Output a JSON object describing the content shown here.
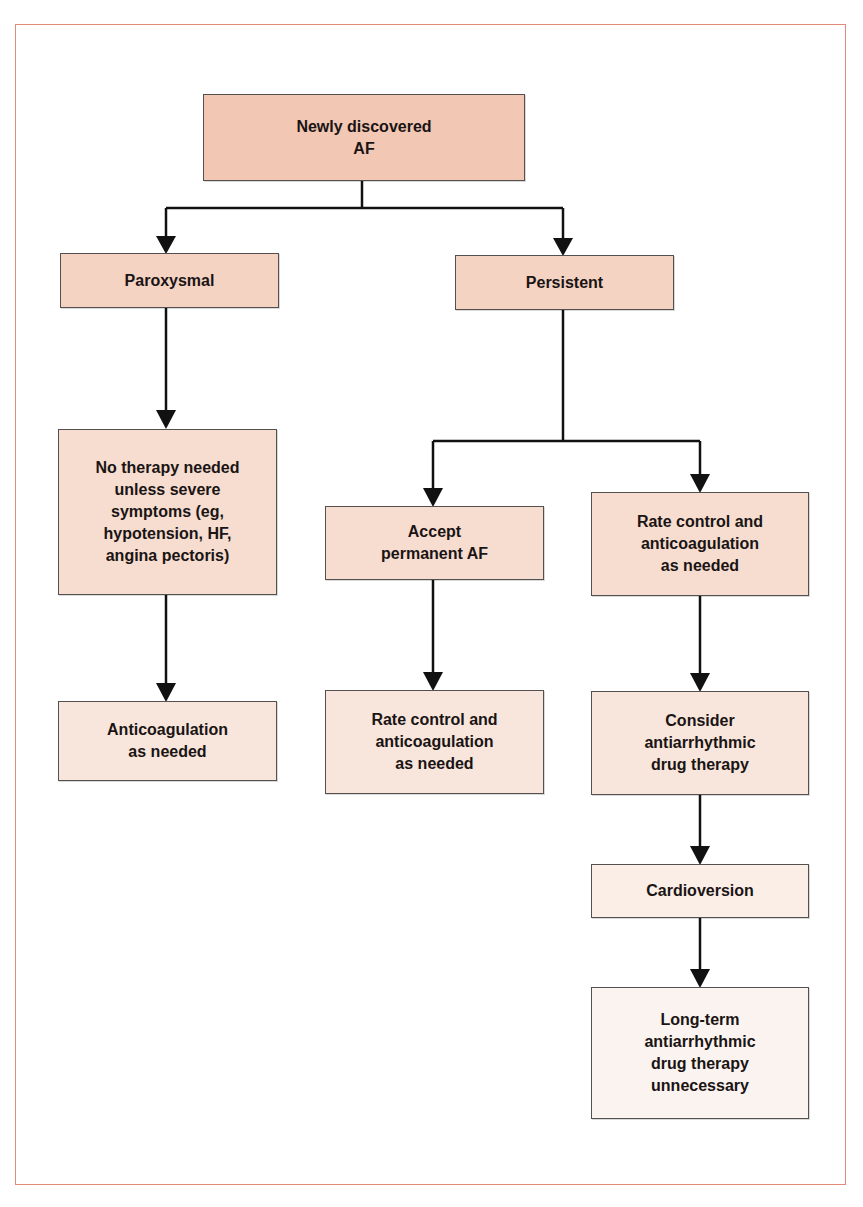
{
  "diagram": {
    "type": "flowchart",
    "frame_color": "#e08a7a",
    "nodes": {
      "root": "Newly discovered\nAF",
      "paroxysmal": "Paroxysmal",
      "persistent": "Persistent",
      "no_therapy": "No therapy needed\nunless severe\nsymptoms (eg,\nhypotension, HF,\nangina pectoris)",
      "anticoagulation": "Anticoagulation\nas needed",
      "accept_permanent": "Accept\npermanent AF",
      "rate_control_right": "Rate control and\nanticoagulation\nas needed",
      "rate_control_mid": "Rate control and\nanticoagulation\nas needed",
      "consider_antiarrhythmic": "Consider\nantiarrhythmic\ndrug therapy",
      "cardioversion": "Cardioversion",
      "long_term": "Long-term\nantiarrhythmic\ndrug therapy\nunnecessary"
    },
    "edges": [
      [
        "root",
        "paroxysmal"
      ],
      [
        "root",
        "persistent"
      ],
      [
        "paroxysmal",
        "no_therapy"
      ],
      [
        "no_therapy",
        "anticoagulation"
      ],
      [
        "persistent",
        "accept_permanent"
      ],
      [
        "persistent",
        "rate_control_right"
      ],
      [
        "accept_permanent",
        "rate_control_mid"
      ],
      [
        "rate_control_right",
        "consider_antiarrhythmic"
      ],
      [
        "consider_antiarrhythmic",
        "cardioversion"
      ],
      [
        "cardioversion",
        "long_term"
      ]
    ]
  }
}
